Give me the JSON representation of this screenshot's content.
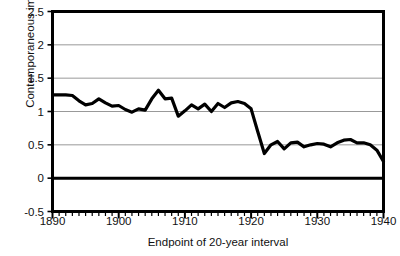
{
  "chart_data": {
    "type": "line",
    "title": "",
    "xlabel": "Endpoint of 20-year interval",
    "ylabel": "Contemporaneous impact",
    "xlim": [
      1890,
      1940
    ],
    "ylim": [
      -0.5,
      2.5
    ],
    "xticks": [
      1890,
      1900,
      1910,
      1920,
      1930,
      1940
    ],
    "xtick_labels": [
      "1890",
      "1900",
      "1910",
      "1920",
      "1930",
      "1940"
    ],
    "yticks": [
      -0.5,
      0,
      0.5,
      1,
      1.5,
      2,
      2.5
    ],
    "ytick_labels": [
      "-0.5",
      "0",
      "0.5",
      "1",
      "1.5",
      "2",
      "2.5"
    ],
    "minor_xtick_step": 1,
    "grid": "horizontal",
    "gridline_values": [
      0.5,
      1,
      1.5,
      2
    ],
    "zero_line_value": 0,
    "legend": "none",
    "line_color": "#000000",
    "grid_color": "#999999",
    "axis_color": "#000000",
    "background": "#ffffff",
    "series": [
      {
        "name": "Contemporaneous impact",
        "x": [
          1890,
          1891,
          1892,
          1893,
          1894,
          1895,
          1896,
          1897,
          1898,
          1899,
          1900,
          1901,
          1902,
          1903,
          1904,
          1905,
          1906,
          1907,
          1908,
          1909,
          1910,
          1911,
          1912,
          1913,
          1914,
          1915,
          1916,
          1917,
          1918,
          1919,
          1920,
          1921,
          1922,
          1923,
          1924,
          1925,
          1926,
          1927,
          1928,
          1929,
          1930,
          1931,
          1932,
          1933,
          1934,
          1935,
          1936,
          1937,
          1938,
          1939,
          1940
        ],
        "values": [
          1.25,
          1.25,
          1.25,
          1.24,
          1.16,
          1.1,
          1.12,
          1.19,
          1.13,
          1.08,
          1.09,
          1.03,
          0.99,
          1.04,
          1.02,
          1.19,
          1.32,
          1.19,
          1.2,
          0.93,
          1.01,
          1.1,
          1.04,
          1.11,
          1.0,
          1.12,
          1.06,
          1.13,
          1.15,
          1.12,
          1.04,
          0.7,
          0.37,
          0.5,
          0.55,
          0.44,
          0.53,
          0.54,
          0.47,
          0.5,
          0.52,
          0.51,
          0.47,
          0.53,
          0.57,
          0.58,
          0.53,
          0.53,
          0.5,
          0.42,
          0.25
        ]
      }
    ]
  }
}
